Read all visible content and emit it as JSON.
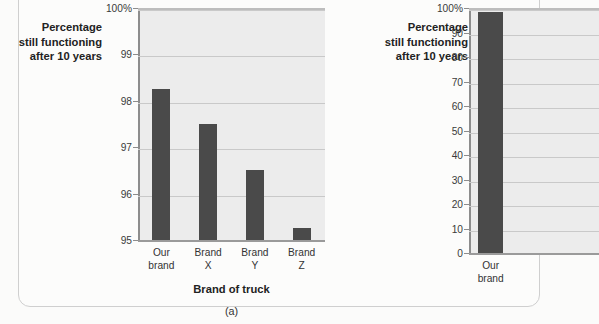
{
  "figure": {
    "background_color": "#fcfcfb",
    "bar_color": "#4a4a4a",
    "plot_background_color": "#ececec",
    "gridline_color": "#c9c9c9"
  },
  "chart_data": [
    {
      "type": "bar",
      "panel_label": "(a)",
      "title": "",
      "ylabel": "Percentage still functioning after 10 years",
      "ylabel_lines": [
        "Percentage",
        "still functioning",
        "after 10 years"
      ],
      "xlabel": "Brand of truck",
      "categories": [
        "Our brand",
        "Brand X",
        "Brand Y",
        "Brand Z"
      ],
      "category_lines": [
        [
          "Our",
          "brand"
        ],
        [
          "Brand",
          "X"
        ],
        [
          "Brand",
          "Y"
        ],
        [
          "Brand",
          "Z"
        ]
      ],
      "values": [
        98.25,
        97.5,
        96.5,
        95.25
      ],
      "ylim": [
        95,
        100
      ],
      "yticks": [
        95,
        96,
        97,
        98,
        99,
        100
      ],
      "ytick_labels": [
        "95",
        "96",
        "97",
        "98",
        "99",
        "100%"
      ],
      "grid": true,
      "legend": "none"
    },
    {
      "type": "bar",
      "panel_label": "(b)",
      "title": "",
      "ylabel": "Percentage still functioning after 10 years",
      "ylabel_lines": [
        "Percentage",
        "still functioning",
        "after 10 years"
      ],
      "xlabel": "",
      "categories": [
        "Our brand"
      ],
      "category_lines": [
        [
          "Our",
          "brand"
        ]
      ],
      "values": [
        98.25
      ],
      "ylim": [
        0,
        100
      ],
      "yticks": [
        0,
        10,
        20,
        30,
        40,
        50,
        60,
        70,
        80,
        90,
        100
      ],
      "ytick_labels": [
        "0",
        "10",
        "20",
        "30",
        "40",
        "50",
        "60",
        "70",
        "80",
        "90",
        "100%"
      ],
      "grid": true,
      "legend": "none",
      "note": "panel cropped at right edge of screenshot"
    }
  ]
}
